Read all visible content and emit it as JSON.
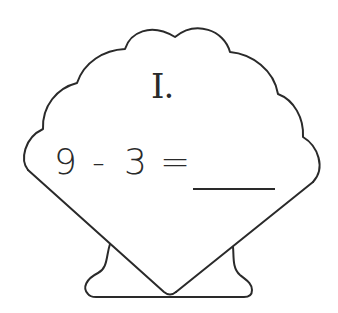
{
  "worksheet": {
    "shape": "scallop-shell",
    "problem_label": "I.",
    "equation": {
      "operand_a": "9",
      "operator": "-",
      "operand_b": "3",
      "equals": "=",
      "answer": ""
    },
    "colors": {
      "stroke": "#2a2a2a",
      "background": "#ffffff"
    }
  }
}
